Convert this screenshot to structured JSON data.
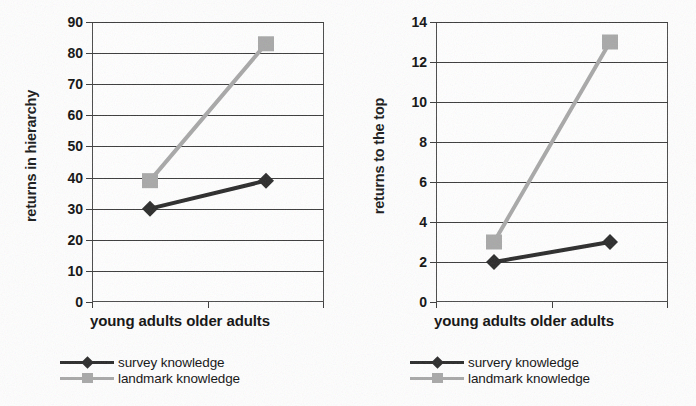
{
  "colors": {
    "survey": "#2b2b2b",
    "landmark": "#a8a8a8",
    "axis": "#3b3b3b",
    "text": "#111111",
    "background": "#ffffff"
  },
  "figures": [
    {
      "id": "returns-in-hierarchy",
      "ylabel": "returns in hierarchy",
      "xlabel": "young adults older adults",
      "yticks": [
        "0",
        "10",
        "20",
        "30",
        "40",
        "50",
        "60",
        "70",
        "80",
        "90"
      ],
      "legend": [
        {
          "label": "survey knowledge",
          "marker": "diamond",
          "color": "#2b2b2b"
        },
        {
          "label": "landmark knowledge",
          "marker": "square",
          "color": "#a8a8a8"
        }
      ]
    },
    {
      "id": "returns-to-the-top",
      "ylabel": "returns to the top",
      "xlabel": "young adults older adults",
      "yticks": [
        "0",
        "2",
        "4",
        "6",
        "8",
        "10",
        "12",
        "14"
      ],
      "legend": [
        {
          "label": "survery knowledge",
          "marker": "diamond",
          "color": "#2b2b2b"
        },
        {
          "label": "landmark knowledge",
          "marker": "square",
          "color": "#a8a8a8"
        }
      ]
    }
  ],
  "chart_data": [
    {
      "type": "line",
      "title": "",
      "xlabel": "young adults older adults",
      "ylabel": "returns in hierarchy",
      "categories": [
        "young adults",
        "older adults"
      ],
      "ylim": [
        0,
        90
      ],
      "ytick_step": 10,
      "grid": true,
      "legend_position": "bottom-left",
      "series": [
        {
          "name": "survey knowledge",
          "values": [
            30,
            39
          ],
          "marker": "diamond",
          "color": "#2b2b2b"
        },
        {
          "name": "landmark knowledge",
          "values": [
            39,
            83
          ],
          "marker": "square",
          "color": "#a8a8a8"
        }
      ]
    },
    {
      "type": "line",
      "title": "",
      "xlabel": "young adults older adults",
      "ylabel": "returns to the top",
      "categories": [
        "young adults",
        "older adults"
      ],
      "ylim": [
        0,
        14
      ],
      "ytick_step": 2,
      "grid": true,
      "legend_position": "bottom-left",
      "series": [
        {
          "name": "survery knowledge",
          "values": [
            2,
            3
          ],
          "marker": "diamond",
          "color": "#2b2b2b"
        },
        {
          "name": "landmark knowledge",
          "values": [
            3,
            13
          ],
          "marker": "square",
          "color": "#a8a8a8"
        }
      ]
    }
  ]
}
